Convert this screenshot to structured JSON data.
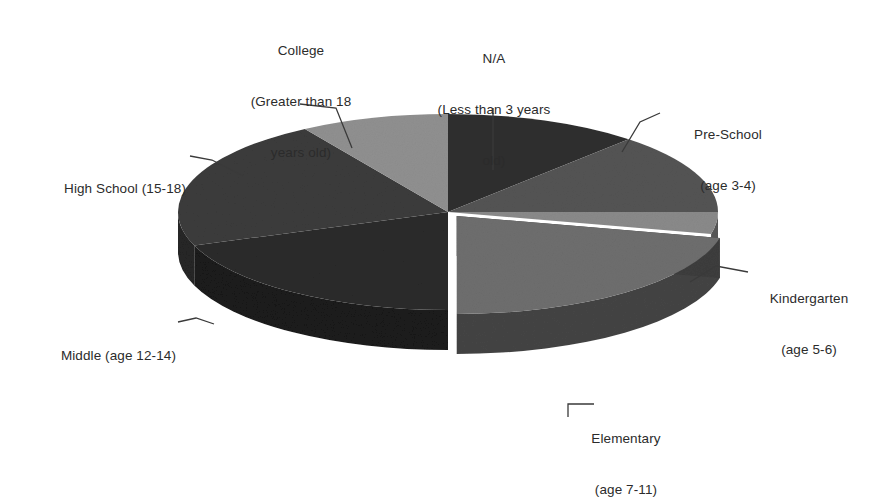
{
  "figure": {
    "kind": "3d-exploded-pie-chart",
    "background": "#ffffff",
    "text_color": "#2b2b2b",
    "leader_line_color": "#3a3a3a"
  },
  "chart_data": {
    "type": "pie",
    "title": "",
    "xlabel": "",
    "ylabel": "",
    "legend_position": "none",
    "labels_position": "outside-with-leader-lines",
    "three_d": true,
    "start_angle_deg": 0,
    "categories": [
      "N/A\n(Less than 3 years\nold)",
      "Pre-School\n(age 3-4)",
      "Kindergarten\n(age 5-6)",
      "Elementary\n(age 7-11)",
      "Middle (age 12-14)",
      "High School (15-18)",
      "College\n(Greater than 18\nyears old)"
    ],
    "slices": [
      {
        "name": "N/A (Less than 3 years old)",
        "value": 11.7,
        "start_deg": 0.0,
        "end_deg": 42.0,
        "color": "#2f2f2f",
        "exploded": false
      },
      {
        "name": "Pre-School (age 3-4)",
        "value": 13.3,
        "start_deg": 42.0,
        "end_deg": 90.0,
        "color": "#545454",
        "exploded": false
      },
      {
        "name": "Kindergarten (age 5-6)",
        "value": 3.6,
        "start_deg": 90.0,
        "end_deg": 103.0,
        "color": "#8a8a8a",
        "exploded": false
      },
      {
        "name": "Elementary (age 7-11)",
        "value": 21.4,
        "start_deg": 103.0,
        "end_deg": 180.0,
        "color": "#6e6e6e",
        "exploded": true
      },
      {
        "name": "Middle (age 12-14)",
        "value": 19.4,
        "start_deg": 180.0,
        "end_deg": 250.0,
        "color": "#2a2a2a",
        "exploded": false
      },
      {
        "name": "High School (15-18)",
        "value": 21.7,
        "start_deg": 250.0,
        "end_deg": 328.0,
        "color": "#3b3b3b",
        "exploded": false
      },
      {
        "name": "College (Greater than 18 years old)",
        "value": 8.9,
        "start_deg": 328.0,
        "end_deg": 360.0,
        "color": "#909090",
        "exploded": false
      }
    ]
  },
  "labels": {
    "na": {
      "line1": "N/A",
      "line2": "(Less than 3 years",
      "line3": "old)"
    },
    "preschool": {
      "line1": "Pre-School",
      "line2": "(age 3-4)"
    },
    "kindergarten": {
      "line1": "Kindergarten",
      "line2": "(age 5-6)"
    },
    "elementary": {
      "line1": "Elementary",
      "line2": "(age 7-11)"
    },
    "middle": {
      "line1": "Middle (age 12-14)"
    },
    "highschool": {
      "line1": "High School (15-18)"
    },
    "college": {
      "line1": "College",
      "line2": "(Greater than 18",
      "line3": "years old)"
    }
  }
}
